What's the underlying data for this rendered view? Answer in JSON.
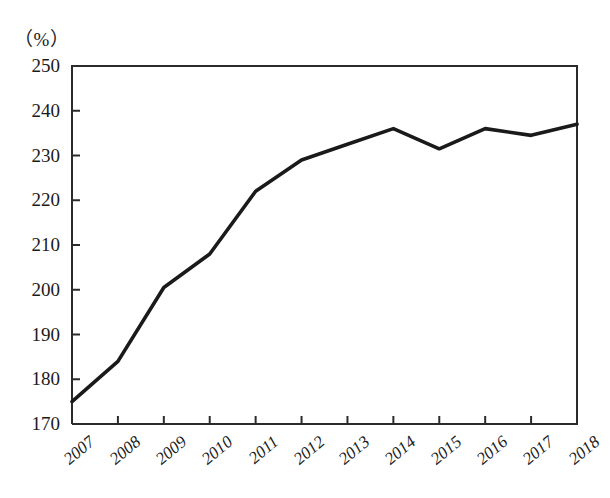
{
  "chart_data": {
    "type": "line",
    "title": "",
    "subtitle": "",
    "unit_label": "（%）",
    "xlabel": "",
    "ylabel": "",
    "categories": [
      "2007",
      "2008",
      "2009",
      "2010",
      "2011",
      "2012",
      "2013",
      "2014",
      "2015",
      "2016",
      "2017",
      "2018"
    ],
    "values": [
      175,
      184,
      200.5,
      208,
      222,
      229,
      232.5,
      236,
      231.5,
      236,
      234.5,
      237
    ],
    "series": [
      {
        "name": "",
        "values": [
          175,
          184,
          200.5,
          208,
          222,
          229,
          232.5,
          236,
          231.5,
          236,
          234.5,
          237
        ]
      }
    ],
    "ylim": [
      170,
      250
    ],
    "yticks": [
      170,
      180,
      190,
      200,
      210,
      220,
      230,
      240,
      250
    ],
    "ytick_labels": [
      "170",
      "180",
      "190",
      "200",
      "210",
      "220",
      "230",
      "240",
      "250"
    ],
    "xtick_labels": [
      "2007",
      "2008",
      "2009",
      "2010",
      "2011",
      "2012",
      "2013",
      "2014",
      "2015",
      "2016",
      "2017",
      "2018"
    ],
    "grid": false,
    "legend": "none",
    "line_color": "#1a1a1a",
    "axis_color": "#2b2b2b",
    "background": "#ffffff"
  },
  "axes": {
    "y_axis_name": "percent-axis",
    "x_axis_name": "year-axis"
  }
}
